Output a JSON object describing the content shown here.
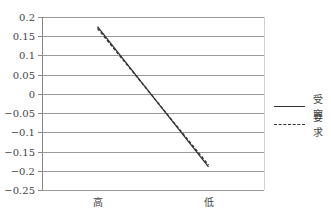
{
  "chart_data": {
    "type": "line",
    "title": "",
    "xlabel": "",
    "ylabel": "",
    "categories": [
      "高",
      "低"
    ],
    "series": [
      {
        "name": "受容",
        "style": "solid",
        "values": [
          0.175,
          -0.19
        ]
      },
      {
        "name": "要求",
        "style": "dashed",
        "values": [
          0.17,
          -0.185
        ]
      }
    ],
    "ylim": [
      -0.25,
      0.2
    ],
    "yticks": [
      0.2,
      0.15,
      0.1,
      0.05,
      0,
      -0.05,
      -0.1,
      -0.15,
      -0.2,
      -0.25
    ],
    "ytick_labels": [
      "0.2",
      "0.15",
      "0.1",
      "0.05",
      "0",
      "-0.05",
      "-0.1",
      "-0.15",
      "-0.2",
      "-0.25"
    ],
    "grid": true,
    "legend_position": "right"
  },
  "legend": {
    "items": [
      {
        "label": "受容",
        "style": "solid"
      },
      {
        "label": "要求",
        "style": "dashed"
      }
    ]
  },
  "colors": {
    "line": "#333333",
    "grid": "#9a9a9a",
    "axis": "#888888"
  }
}
